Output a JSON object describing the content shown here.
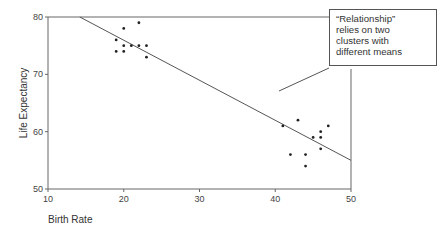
{
  "chart_data": {
    "type": "scatter",
    "title": "",
    "xlabel": "Birth Rate",
    "ylabel": "Life Expectancy",
    "xlim": [
      10,
      50
    ],
    "ylim": [
      50,
      80
    ],
    "x_ticks": [
      "10",
      "20",
      "30",
      "40",
      "50"
    ],
    "y_ticks": [
      "50",
      "60",
      "70",
      "80"
    ],
    "grid": false,
    "legend": null,
    "series": [
      {
        "name": "high-life-expectancy cluster",
        "points": [
          {
            "x": 20,
            "y": 78
          },
          {
            "x": 22,
            "y": 79
          },
          {
            "x": 19,
            "y": 76
          },
          {
            "x": 20,
            "y": 75
          },
          {
            "x": 21,
            "y": 75
          },
          {
            "x": 22,
            "y": 75
          },
          {
            "x": 23,
            "y": 75
          },
          {
            "x": 19,
            "y": 74
          },
          {
            "x": 20,
            "y": 74
          },
          {
            "x": 23,
            "y": 73
          }
        ]
      },
      {
        "name": "low-life-expectancy cluster",
        "points": [
          {
            "x": 43,
            "y": 62
          },
          {
            "x": 41,
            "y": 61
          },
          {
            "x": 47,
            "y": 61
          },
          {
            "x": 46,
            "y": 60
          },
          {
            "x": 45,
            "y": 59
          },
          {
            "x": 46,
            "y": 59
          },
          {
            "x": 46,
            "y": 57
          },
          {
            "x": 42,
            "y": 56
          },
          {
            "x": 44,
            "y": 56
          },
          {
            "x": 44,
            "y": 54
          }
        ]
      }
    ],
    "regression_line": {
      "x1": 14.2,
      "y1": 80,
      "x2": 50,
      "y2": 55
    },
    "annotations": [
      {
        "text": "“Relationship” relies on two clusters with different means",
        "lines": [
          "“Relationship”",
          "relies on two",
          "clusters with",
          "different means"
        ],
        "points_to": {
          "x": 40.4,
          "y": 67
        }
      }
    ]
  },
  "labels": {
    "xlabel": "Birth Rate",
    "ylabel": "Life Expectancy"
  },
  "callout": {
    "line1": "“Relationship”",
    "line2": "relies on two",
    "line3": "clusters with",
    "line4": "different means"
  }
}
